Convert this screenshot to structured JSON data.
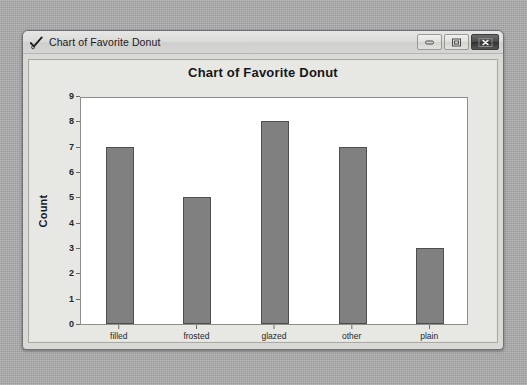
{
  "window": {
    "title": "Chart of Favorite Donut",
    "icon": "minitab-check-icon",
    "controls": [
      {
        "name": "minimize-button",
        "label": "Minimize",
        "glyph": "minimize-icon"
      },
      {
        "name": "maximize-button",
        "label": "Maximize",
        "glyph": "maximize-icon"
      },
      {
        "name": "close-button",
        "label": "Close",
        "glyph": "close-icon"
      }
    ]
  },
  "colors": {
    "bar_fill": "#808080",
    "bar_border": "#4e4e4e",
    "plot_background": "#ffffff",
    "graph_background": "#e7e7e4",
    "desktop": "#a9a9a9",
    "axis": "#8e8e8b"
  },
  "chart_data": {
    "type": "bar",
    "title": "Chart of Favorite Donut",
    "xlabel": "Favorite Donut",
    "ylabel": "Count",
    "categories": [
      "filled",
      "frosted",
      "glazed",
      "other",
      "plain"
    ],
    "values": [
      7,
      5,
      8,
      7,
      3
    ],
    "ylim": [
      0,
      9
    ],
    "yticks": [
      0,
      1,
      2,
      3,
      4,
      5,
      6,
      7,
      8,
      9
    ],
    "ytick_labels": [
      "0",
      "1",
      "2",
      "3",
      "4",
      "5",
      "6",
      "7",
      "8",
      "9"
    ],
    "grid": false,
    "legend": null,
    "series": [
      {
        "name": "Count",
        "values": [
          7,
          5,
          8,
          7,
          3
        ]
      }
    ]
  }
}
